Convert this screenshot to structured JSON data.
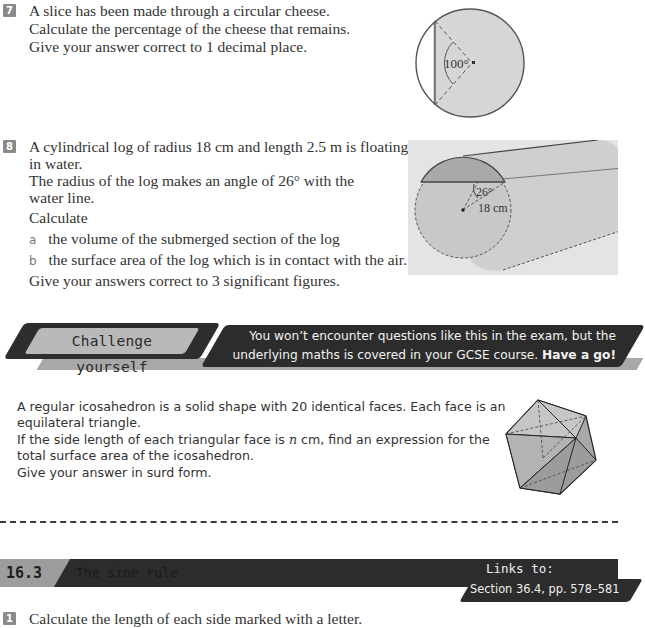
{
  "question7": {
    "number": "7",
    "lines": [
      "A slice has been made through a circular cheese.",
      "Calculate the percentage of the cheese that remains.",
      "Give your answer correct to 1 decimal place."
    ],
    "diagram": {
      "angle_label": "100°",
      "icon": "circle-segment-diagram"
    }
  },
  "question8": {
    "number": "8",
    "intro_lines": [
      "A cylindrical log of radius 18 cm and length 2.5 m is floating",
      "in water.",
      "The radius of the log makes an angle of 26° with the",
      "water line."
    ],
    "calculate": "Calculate",
    "parts": [
      {
        "label": "a",
        "text": "the volume of the submerged section of the log"
      },
      {
        "label": "b",
        "text": "the surface area of the log which is in contact with the air."
      }
    ],
    "footer": "Give your answers correct to 3 significant figures.",
    "diagram": {
      "angle_label": "26°",
      "radius_label": "18 cm",
      "icon": "floating-log-diagram"
    }
  },
  "challenge": {
    "label": "Challenge yourself",
    "banner_line1": "You won’t encounter questions like this in the exam, but the",
    "banner_line2_prefix": "underlying maths is covered in your GCSE course. ",
    "banner_line2_bold": "Have a go!",
    "body_lines": [
      "A regular icosahedron is a solid shape with 20 identical faces. Each face is an",
      "equilateral triangle."
    ],
    "body_line3_prefix": "If the side length of each triangular face is ",
    "body_line3_var": "n",
    "body_line3_suffix": " cm, find an expression for the",
    "body_lines_after": [
      "total surface area of the icosahedron.",
      "Give your answer in surd form."
    ],
    "diagram": {
      "icon": "icosahedron-diagram"
    }
  },
  "section": {
    "number": "16.3",
    "title": "The sine rule",
    "links_label": "Links to:",
    "links_value": "Section 36.4, pp. 578–581"
  },
  "question1": {
    "number": "1",
    "text": "Calculate the length of each side marked with a letter."
  }
}
